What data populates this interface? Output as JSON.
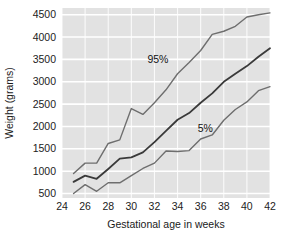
{
  "chart_data": {
    "type": "line",
    "title": "",
    "subtitle": "",
    "xlabel": "Gestational age in weeks",
    "ylabel": "Weight (grams)",
    "xlim": [
      24,
      42
    ],
    "ylim": [
      400,
      4650
    ],
    "xticks": [
      24,
      26,
      28,
      30,
      32,
      34,
      36,
      38,
      40,
      42
    ],
    "xticklabels": [
      "24",
      "26",
      "28",
      "30",
      "32",
      "34",
      "36",
      "38",
      "40",
      "42"
    ],
    "yticks": [
      500,
      1000,
      1500,
      2000,
      2500,
      3000,
      3500,
      4000,
      4500
    ],
    "yticklabels": [
      "500",
      "1000",
      "1500",
      "2000",
      "2500",
      "3000",
      "3500",
      "4000",
      "4500"
    ],
    "grid": true,
    "grid_color": "#ffffff",
    "plot_background": "#e2e2e2",
    "legend_position": "inline-annotations",
    "x": [
      25,
      26,
      27,
      28,
      29,
      30,
      31,
      32,
      33,
      34,
      35,
      36,
      37,
      38,
      39,
      40,
      41,
      42
    ],
    "series": [
      {
        "name": "95%",
        "label": "95%",
        "color": "#6e6e6e",
        "linewidth": 1.4,
        "annotation": "95%",
        "annotation_x": 32.3,
        "annotation_y": 3430,
        "values": [
          950,
          1180,
          1180,
          1620,
          1700,
          2400,
          2270,
          2530,
          2820,
          3180,
          3430,
          3700,
          4060,
          4130,
          4240,
          4450,
          4500,
          4540
        ]
      },
      {
        "name": "50%",
        "label": "50th percentile",
        "color": "#3a3a3a",
        "linewidth": 1.8,
        "annotation": "",
        "annotation_x": null,
        "annotation_y": null,
        "values": [
          760,
          900,
          830,
          1050,
          1280,
          1310,
          1420,
          1650,
          1900,
          2150,
          2300,
          2530,
          2740,
          3000,
          3180,
          3350,
          3560,
          3750
        ]
      },
      {
        "name": "5%",
        "label": "5%",
        "color": "#6e6e6e",
        "linewidth": 1.4,
        "annotation": "5%",
        "annotation_x": 36.4,
        "annotation_y": 1870,
        "values": [
          500,
          700,
          550,
          740,
          740,
          900,
          1060,
          1180,
          1450,
          1440,
          1460,
          1720,
          1810,
          2140,
          2380,
          2550,
          2800,
          2890
        ]
      }
    ]
  }
}
